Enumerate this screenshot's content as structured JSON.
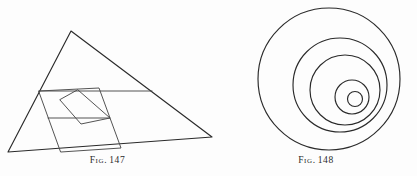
{
  "plate": {
    "background_color": "#fdfdfd",
    "ink_color": "#2a2a2a",
    "width": 417,
    "height": 176
  },
  "figures": [
    {
      "id": "fig-147",
      "caption_word": "Fig.",
      "caption_number": "147",
      "caption_full": "Fig. 147",
      "kind": "line-diagram",
      "description": "Triangle with inscribed midline, inscribed tilted square and a smaller nested square",
      "geometry": {
        "triangle": {
          "apex": [
            71,
            31
          ],
          "left": [
            8,
            152
          ],
          "right": [
            212,
            137
          ]
        },
        "midline": {
          "from": [
            39,
            91
          ],
          "to": [
            152,
            91
          ]
        },
        "inscribed_square": [
          [
            39,
            91
          ],
          [
            99,
            88
          ],
          [
            121,
            148
          ],
          [
            61,
            152
          ]
        ],
        "inner_square": [
          [
            78,
            90
          ],
          [
            110,
            118
          ],
          [
            81,
            124
          ],
          [
            60,
            100
          ]
        ],
        "inner_horizontal": {
          "from": [
            48,
            118
          ],
          "to": [
            110,
            118
          ]
        }
      }
    },
    {
      "id": "fig-148",
      "caption_word": "Fig.",
      "caption_number": "148",
      "caption_full": "Fig. 148",
      "kind": "circle-diagram",
      "description": "Five nested non-concentric circles drifting toward the lower right",
      "geometry": {
        "circles": [
          {
            "index": 1,
            "cx": 329,
            "cy": 79,
            "r": 71
          },
          {
            "index": 2,
            "cx": 340,
            "cy": 85,
            "r": 47
          },
          {
            "index": 3,
            "cx": 345,
            "cy": 90,
            "r": 35
          },
          {
            "index": 4,
            "cx": 352,
            "cy": 97,
            "r": 17
          },
          {
            "index": 5,
            "cx": 355,
            "cy": 99,
            "r": 7.5
          }
        ]
      }
    }
  ]
}
